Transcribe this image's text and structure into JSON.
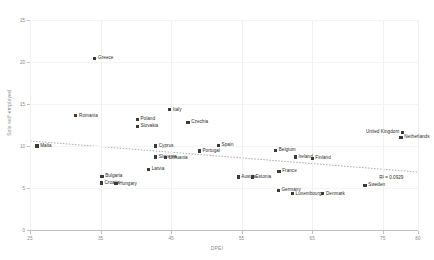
{
  "chart_data": {
    "type": "scatter",
    "title": "",
    "xlabel": "DPEI",
    "ylabel": "Solo self-employed",
    "xlim": [
      25,
      80
    ],
    "ylim": [
      0,
      25
    ],
    "xticks": [
      25,
      35,
      45,
      55,
      65,
      75,
      80
    ],
    "yticks": [
      0,
      5,
      10,
      15,
      20,
      25
    ],
    "grid": true,
    "legend": "none",
    "annotations": [
      {
        "name": "r-squared",
        "text": "R² = 0.0929",
        "x": 74.5,
        "y": 6.6
      }
    ],
    "trendline": {
      "type": "linear",
      "x_start": 25,
      "y_start": 10.6,
      "x_end": 80,
      "y_end": 6.9,
      "style": "dotted"
    },
    "points": [
      {
        "label": "Malta",
        "x": 26.0,
        "y": 10.0,
        "label_side": "right"
      },
      {
        "label": "Romania",
        "x": 31.5,
        "y": 13.6,
        "label_side": "right"
      },
      {
        "label": "Greece",
        "x": 34.2,
        "y": 20.4,
        "label_side": "right"
      },
      {
        "label": "Bulgaria",
        "x": 35.2,
        "y": 6.4,
        "label_side": "right"
      },
      {
        "label": "Croatia",
        "x": 35.1,
        "y": 5.6,
        "label_side": "right"
      },
      {
        "label": "Hungary",
        "x": 37.2,
        "y": 5.5,
        "label_side": "right"
      },
      {
        "label": "Poland",
        "x": 40.2,
        "y": 13.2,
        "label_side": "right"
      },
      {
        "label": "Slovakia",
        "x": 40.2,
        "y": 12.3,
        "label_side": "right"
      },
      {
        "label": "Latvia",
        "x": 41.8,
        "y": 7.2,
        "label_side": "right"
      },
      {
        "label": "Cyprus",
        "x": 42.8,
        "y": 10.0,
        "label_side": "right"
      },
      {
        "label": "Slovenia",
        "x": 42.8,
        "y": 8.7,
        "label_side": "right"
      },
      {
        "label": "Lithuania",
        "x": 44.2,
        "y": 8.6,
        "label_side": "right"
      },
      {
        "label": "Italy",
        "x": 44.8,
        "y": 14.3,
        "label_side": "right"
      },
      {
        "label": "Czechia",
        "x": 47.4,
        "y": 12.8,
        "label_side": "right"
      },
      {
        "label": "Portugal",
        "x": 49.0,
        "y": 9.4,
        "label_side": "right"
      },
      {
        "label": "Spain",
        "x": 51.7,
        "y": 10.1,
        "label_side": "right"
      },
      {
        "label": "Austria",
        "x": 54.5,
        "y": 6.3,
        "label_side": "right"
      },
      {
        "label": "Estonia",
        "x": 56.5,
        "y": 6.3,
        "label_side": "right"
      },
      {
        "label": "Belgium",
        "x": 59.8,
        "y": 9.5,
        "label_side": "right"
      },
      {
        "label": "Germany",
        "x": 60.2,
        "y": 4.7,
        "label_side": "right"
      },
      {
        "label": "France",
        "x": 60.3,
        "y": 7.0,
        "label_side": "right"
      },
      {
        "label": "Luxembourg",
        "x": 62.2,
        "y": 4.3,
        "label_side": "right"
      },
      {
        "label": "Ireland",
        "x": 62.6,
        "y": 8.7,
        "label_side": "right"
      },
      {
        "label": "Finland",
        "x": 65.0,
        "y": 8.5,
        "label_side": "right"
      },
      {
        "label": "Denmark",
        "x": 66.5,
        "y": 4.3,
        "label_side": "right"
      },
      {
        "label": "Sweden",
        "x": 72.5,
        "y": 5.3,
        "label_side": "right"
      },
      {
        "label": "United Kingdom",
        "x": 77.8,
        "y": 11.6,
        "label_side": "left"
      },
      {
        "label": "Netherlands",
        "x": 77.6,
        "y": 11.0,
        "label_side": "right"
      }
    ]
  },
  "style": {
    "marker_color": "#3a3a3a",
    "axis_color": "#bfbfbf",
    "grid_color": "#f0f0f0",
    "label_color": "#2b2b2b",
    "tick_color": "#8a8a8a",
    "background": "#ffffff"
  }
}
